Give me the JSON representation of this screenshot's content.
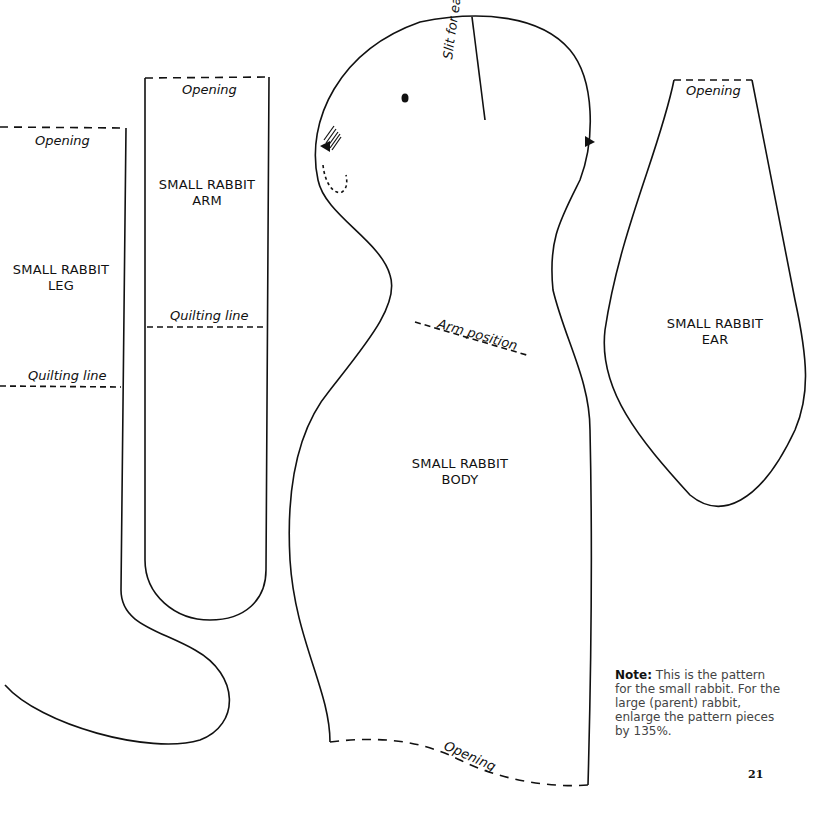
{
  "pieces": {
    "leg": {
      "title_line1": "SMALL RABBIT",
      "title_line2": "LEG",
      "opening": "Opening",
      "quilting": "Quilting line"
    },
    "arm": {
      "title_line1": "SMALL RABBIT",
      "title_line2": "ARM",
      "opening": "Opening",
      "quilting": "Quilting line"
    },
    "body": {
      "title_line1": "SMALL RABBIT",
      "title_line2": "BODY",
      "slit": "Slit for ear",
      "arm_position": "Arm position",
      "opening": "Opening"
    },
    "ear": {
      "title_line1": "SMALL RABBIT",
      "title_line2": "EAR",
      "opening": "Opening"
    }
  },
  "note": {
    "label": "Note:",
    "text": "This is the pattern for the small rabbit. For the large (parent) rabbit, enlarge the pattern pieces by 135%."
  },
  "page_number": "21"
}
